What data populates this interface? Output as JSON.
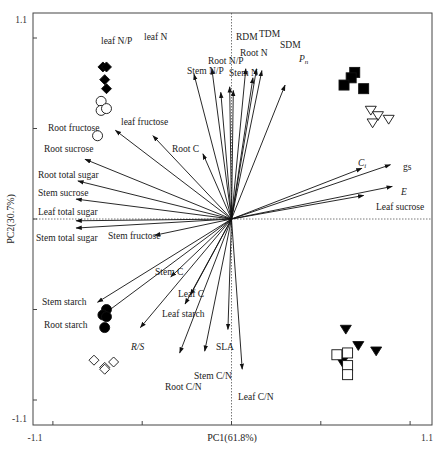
{
  "chart_data": {
    "type": "scatter",
    "subtype": "pca_biplot",
    "title": "",
    "xlabel": "PC1(61.8%)",
    "ylabel": "PC2(30.7%)",
    "xlim": [
      -1.1,
      1.1
    ],
    "ylim": [
      -1.1,
      1.1
    ],
    "x_tick_labels": [
      "-1.1",
      "1.1"
    ],
    "y_tick_labels": [
      "1.1",
      "-1.1"
    ],
    "reference_lines": {
      "x0_dashed": true,
      "y0_dashed": true
    },
    "grid": false,
    "legend": null,
    "loadings": [
      {
        "name": "leaf N/P",
        "x": -0.21,
        "y": 0.8,
        "italic": false
      },
      {
        "name": "leaf N",
        "x": -0.11,
        "y": 0.83,
        "italic": false
      },
      {
        "name": "Stem N/P",
        "x": -0.06,
        "y": 0.7,
        "italic": false
      },
      {
        "name": "Root N/P",
        "x": -0.01,
        "y": 0.73,
        "italic": false
      },
      {
        "name": "Stem N",
        "x": 0.01,
        "y": 0.71,
        "italic": false
      },
      {
        "name": "RDM",
        "x": 0.08,
        "y": 0.83,
        "italic": false
      },
      {
        "name": "Root N",
        "x": 0.12,
        "y": 0.78,
        "italic": false
      },
      {
        "name": "TDM",
        "x": 0.14,
        "y": 0.83,
        "italic": false
      },
      {
        "name": "SDM",
        "x": 0.17,
        "y": 0.82,
        "italic": false
      },
      {
        "name": "Pn",
        "x": 0.3,
        "y": 0.74,
        "italic": true,
        "subscript": "n"
      },
      {
        "name": "Ci",
        "x": 0.73,
        "y": 0.28,
        "italic": true,
        "subscript": "i"
      },
      {
        "name": "gs",
        "x": 0.89,
        "y": 0.3,
        "italic": false
      },
      {
        "name": "E",
        "x": 0.9,
        "y": 0.18,
        "italic": true
      },
      {
        "name": "Leaf sucrose",
        "x": 0.74,
        "y": 0.13,
        "italic": false
      },
      {
        "name": "Root fructose",
        "x": -0.65,
        "y": 0.49,
        "italic": false
      },
      {
        "name": "leaf fructose",
        "x": -0.44,
        "y": 0.46,
        "italic": false
      },
      {
        "name": "Root C",
        "x": -0.16,
        "y": 0.36,
        "italic": false
      },
      {
        "name": "Root sucrose",
        "x": -0.82,
        "y": 0.33,
        "italic": false
      },
      {
        "name": "Root total sugar",
        "x": -0.86,
        "y": 0.21,
        "italic": false
      },
      {
        "name": "Stem sucrose",
        "x": -0.87,
        "y": 0.11,
        "italic": false
      },
      {
        "name": "Leaf total sugar",
        "x": -0.87,
        "y": -0.01,
        "italic": false
      },
      {
        "name": "Stem total sugar",
        "x": -0.87,
        "y": -0.05,
        "italic": false
      },
      {
        "name": "Stem fructose",
        "x": -0.43,
        "y": -0.09,
        "italic": false
      },
      {
        "name": "Stem C",
        "x": -0.34,
        "y": -0.32,
        "italic": false
      },
      {
        "name": "Stem starch",
        "x": -0.75,
        "y": -0.46,
        "italic": false
      },
      {
        "name": "Root starch",
        "x": -0.72,
        "y": -0.53,
        "italic": false
      },
      {
        "name": "Leaf C",
        "x": -0.23,
        "y": -0.42,
        "italic": false
      },
      {
        "name": "Leaf starch",
        "x": -0.26,
        "y": -0.47,
        "italic": false
      },
      {
        "name": "R/S",
        "x": -0.51,
        "y": -0.6,
        "italic": true
      },
      {
        "name": "SLA",
        "x": -0.02,
        "y": -0.61,
        "italic": false
      },
      {
        "name": "Stem C/N",
        "x": -0.15,
        "y": -0.73,
        "italic": false
      },
      {
        "name": "Root C/N",
        "x": -0.29,
        "y": -0.74,
        "italic": false
      },
      {
        "name": "Leaf C/N",
        "x": 0.06,
        "y": -0.83,
        "italic": false
      }
    ],
    "scores": [
      {
        "group": "filled-diamond",
        "marker": "diamond",
        "fill": "#000000",
        "points": [
          [
            -0.72,
            0.84
          ],
          [
            -0.7,
            0.84
          ],
          [
            -0.71,
            0.77
          ],
          [
            -0.7,
            0.72
          ]
        ]
      },
      {
        "group": "open-circle",
        "marker": "circle",
        "fill": "none",
        "points": [
          [
            -0.73,
            0.65
          ],
          [
            -0.73,
            0.6
          ],
          [
            -0.7,
            0.61
          ],
          [
            -0.75,
            0.46
          ]
        ]
      },
      {
        "group": "filled-square",
        "marker": "square",
        "fill": "#000000",
        "points": [
          [
            0.69,
            0.81
          ],
          [
            0.67,
            0.78
          ],
          [
            0.63,
            0.74
          ],
          [
            0.74,
            0.72
          ]
        ]
      },
      {
        "group": "open-triangle-down",
        "marker": "triangle-down",
        "fill": "none",
        "points": [
          [
            0.78,
            0.6
          ],
          [
            0.82,
            0.57
          ],
          [
            0.79,
            0.53
          ],
          [
            0.88,
            0.55
          ]
        ]
      },
      {
        "group": "filled-circle",
        "marker": "circle",
        "fill": "#000000",
        "points": [
          [
            -0.7,
            -0.5
          ],
          [
            -0.72,
            -0.53
          ],
          [
            -0.7,
            -0.54
          ],
          [
            -0.71,
            -0.6
          ]
        ]
      },
      {
        "group": "open-diamond",
        "marker": "diamond",
        "fill": "none",
        "points": [
          [
            -0.77,
            -0.78
          ],
          [
            -0.71,
            -0.82
          ],
          [
            -0.66,
            -0.79
          ],
          [
            -0.71,
            -0.83
          ]
        ]
      },
      {
        "group": "filled-triangle-down",
        "marker": "triangle-down",
        "fill": "#000000",
        "points": [
          [
            0.64,
            -0.61
          ],
          [
            0.71,
            -0.7
          ],
          [
            0.81,
            -0.73
          ],
          [
            0.62,
            -0.79
          ]
        ]
      },
      {
        "group": "open-square",
        "marker": "square",
        "fill": "none",
        "points": [
          [
            0.59,
            -0.75
          ],
          [
            0.65,
            -0.74
          ],
          [
            0.65,
            -0.81
          ],
          [
            0.65,
            -0.86
          ]
        ]
      }
    ]
  },
  "layout": {
    "plot_left": 33,
    "plot_top": 13,
    "plot_right": 432,
    "plot_bottom": 425,
    "origin_x": 231.5,
    "origin_y": 219,
    "px_per_unit_x": 178.6,
    "px_per_unit_y": 181
  },
  "label_positions": {
    "leaf N/P": [
      101,
      44,
      "start"
    ],
    "leaf N": [
      144,
      40,
      "start"
    ],
    "Stem N/P": [
      187,
      74,
      "start"
    ],
    "Root N/P": [
      208,
      64,
      "start"
    ],
    "Stem N": [
      229,
      76,
      "start"
    ],
    "RDM": [
      236,
      40,
      "start"
    ],
    "Root N": [
      240,
      56,
      "start"
    ],
    "TDM": [
      259,
      37,
      "start"
    ],
    "SDM": [
      280,
      48,
      "start"
    ],
    "Pn": [
      299,
      62,
      "start"
    ],
    "Ci": [
      358,
      166,
      "start"
    ],
    "gs": [
      403,
      170,
      "start"
    ],
    "E": [
      401,
      195,
      "start"
    ],
    "Leaf sucrose": [
      376,
      210,
      "start"
    ],
    "Root fructose": [
      48,
      131,
      "start"
    ],
    "leaf fructose": [
      121,
      125,
      "start"
    ],
    "Root C": [
      172,
      152,
      "start"
    ],
    "Root sucrose": [
      44,
      152,
      "start"
    ],
    "Root total sugar": [
      38,
      178,
      "start"
    ],
    "Stem sucrose": [
      38,
      196,
      "start"
    ],
    "Leaf total sugar": [
      38,
      215,
      "start"
    ],
    "Stem total sugar": [
      36,
      241,
      "start"
    ],
    "Stem fructose": [
      108,
      239,
      "start"
    ],
    "Stem C": [
      155,
      275,
      "start"
    ],
    "Stem starch": [
      42,
      305,
      "start"
    ],
    "Root starch": [
      44,
      328,
      "start"
    ],
    "Leaf C": [
      178,
      297,
      "start"
    ],
    "Leaf starch": [
      162,
      317,
      "start"
    ],
    "R/S": [
      131,
      350,
      "start"
    ],
    "SLA": [
      216,
      350,
      "start"
    ],
    "Stem C/N": [
      194,
      379,
      "start"
    ],
    "Root C/N": [
      165,
      390,
      "start"
    ],
    "Leaf C/N": [
      238,
      400,
      "start"
    ]
  }
}
